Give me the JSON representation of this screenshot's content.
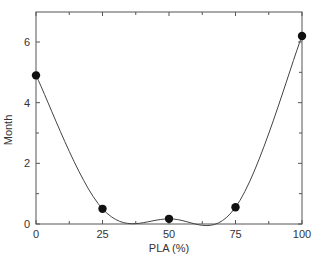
{
  "chart_data": {
    "type": "line",
    "title": "",
    "xlabel": "PLA (%)",
    "ylabel": "Month",
    "x": [
      0,
      25,
      50,
      75,
      100
    ],
    "series": [
      {
        "name": "Month",
        "values": [
          4.9,
          0.5,
          0.17,
          0.55,
          6.2
        ],
        "marker": "filled-circle",
        "line": "smooth"
      }
    ],
    "xlim": [
      0,
      100
    ],
    "ylim": [
      0,
      7
    ],
    "xticks": [
      0,
      25,
      50,
      75,
      100
    ],
    "xtick_labels": [
      "0",
      "25",
      "50",
      "75",
      "100"
    ],
    "yticks": [
      0,
      2,
      4,
      6
    ],
    "ytick_labels": [
      "0",
      "2",
      "4",
      "6"
    ],
    "grid": false,
    "legend": null,
    "colors": {
      "line": "#444444",
      "marker": "#111111",
      "frame": "#555555"
    }
  }
}
